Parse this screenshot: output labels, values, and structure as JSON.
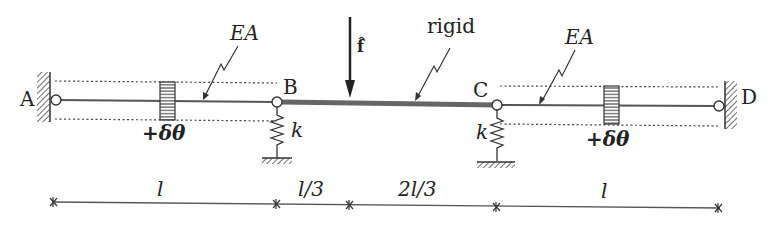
{
  "diagram": {
    "type": "structural-mechanics-schematic",
    "nodes": {
      "A": "A",
      "B": "B",
      "C": "C",
      "D": "D"
    },
    "members": {
      "left_bar_label": "EA",
      "right_bar_label": "EA",
      "middle_beam_label": "rigid"
    },
    "load": {
      "label": "f̂",
      "direction": "down"
    },
    "springs": {
      "left_label": "k",
      "right_label": "k"
    },
    "thermal": {
      "left_label": "+δθ",
      "right_label": "+δθ"
    },
    "dimensions": [
      {
        "label": "l"
      },
      {
        "label": "l/3"
      },
      {
        "label": "2l/3"
      },
      {
        "label": "l"
      }
    ],
    "colors": {
      "line": "#555555",
      "rigid": "#666666",
      "text": "#222222",
      "dotted": "#444444"
    }
  }
}
